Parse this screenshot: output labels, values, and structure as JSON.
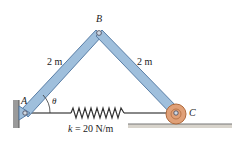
{
  "diagram": {
    "labels": {
      "point_a": "A",
      "point_b": "B",
      "point_c": "C",
      "angle": "θ",
      "length_ab": "2 m",
      "length_bc": "2 m",
      "spring_k_symbol": "k",
      "spring_k_value": " = 20 N/m"
    },
    "colors": {
      "member_fill": "#9fbfdc",
      "member_edge": "#5a7ea6",
      "roller": "#e0a077",
      "roller_edge": "#b06a3c",
      "ground": "#8a8a8a",
      "spring": "#333333"
    }
  }
}
